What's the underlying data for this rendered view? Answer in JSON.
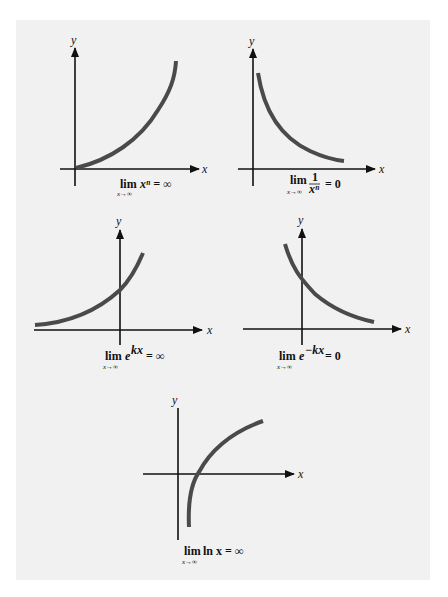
{
  "figure": {
    "background": "#f1f1f1",
    "curve_color": "#4a4a4a",
    "axis_color": "#111111"
  },
  "plots": [
    {
      "id": "power",
      "y_label": "y",
      "x_label": "x",
      "caption": {
        "lim": "lim",
        "sub": "x→∞",
        "body": "xⁿ = ∞"
      }
    },
    {
      "id": "reciprocal-power",
      "y_label": "y",
      "x_label": "x",
      "caption": {
        "lim": "lim",
        "sub": "x→∞",
        "num": "1",
        "den": "xⁿ",
        "rest": "= 0"
      }
    },
    {
      "id": "exp-growth",
      "y_label": "y",
      "x_label": "x",
      "caption": {
        "lim": "lim",
        "sub": "x→∞",
        "body": "e",
        "sup": "kx",
        "rest": "= ∞"
      }
    },
    {
      "id": "exp-decay",
      "y_label": "y",
      "x_label": "x",
      "caption": {
        "lim": "lim",
        "sub": "x→∞",
        "body": "e",
        "sup": "−kx",
        "rest": "= 0"
      }
    },
    {
      "id": "log",
      "y_label": "y",
      "x_label": "x",
      "caption": {
        "lim": "lim",
        "sub": "x→∞",
        "body": "ln x = ∞"
      }
    }
  ]
}
